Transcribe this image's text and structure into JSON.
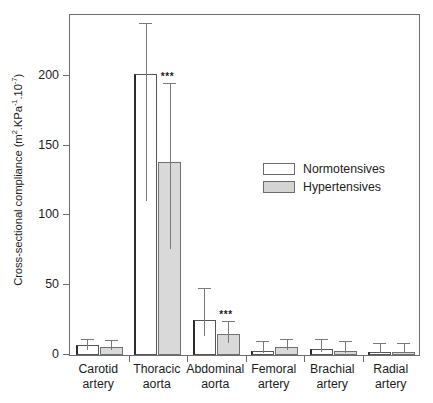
{
  "chart_data": {
    "type": "bar",
    "title": "",
    "xlabel": "",
    "ylabel": "Cross-sectional compliance (m2.KPa-1.10-7)",
    "ylabel_parts": {
      "base1": "Cross-sectional compliance (m",
      "sup1": "2",
      "base2": ".KPa",
      "sup2": "-1",
      "base3": ".10",
      "sup3": "-7",
      "base4": ")"
    },
    "categories": [
      "Carotid artery",
      "Thoracic aorta",
      "Abdominal aorta",
      "Femoral artery",
      "Brachial artery",
      "Radial artery"
    ],
    "category_lines": [
      [
        "Carotid",
        "artery"
      ],
      [
        "Thoracic",
        "aorta"
      ],
      [
        "Abdominal",
        "aorta"
      ],
      [
        "Femoral",
        "artery"
      ],
      [
        "Brachial",
        "artery"
      ],
      [
        "Radial",
        "artery"
      ]
    ],
    "series": [
      {
        "name": "Normotensives",
        "color": "#ffffff",
        "values": [
          7,
          201,
          25,
          3,
          4,
          2
        ],
        "errors": [
          4,
          36,
          22,
          6,
          7,
          6
        ]
      },
      {
        "name": "Hypertensives",
        "color": "#d9d9d9",
        "values": [
          6,
          138,
          15,
          6,
          3,
          2
        ],
        "errors": [
          4,
          56,
          9,
          5,
          6,
          6
        ]
      }
    ],
    "annotations": [
      {
        "text": "***",
        "category": "Thoracic aorta",
        "series": "Hypertensives"
      },
      {
        "text": "***",
        "category": "Abdominal aorta",
        "series": "Hypertensives"
      }
    ],
    "yticks": [
      0,
      50,
      100,
      150,
      200
    ],
    "ytick_labels": [
      "0",
      "50",
      "100",
      "150",
      "200"
    ],
    "ylim": [
      0,
      245
    ],
    "grid": false,
    "legend_position": "center-right"
  },
  "legend": {
    "items": [
      {
        "label": "Normotensives",
        "swatch": "#ffffff"
      },
      {
        "label": "Hypertensives",
        "swatch": "#d4d4d4"
      }
    ]
  },
  "axis": {
    "y_title_text": "Cross-sectional compliance (m2.KPa-1.10-7)"
  }
}
